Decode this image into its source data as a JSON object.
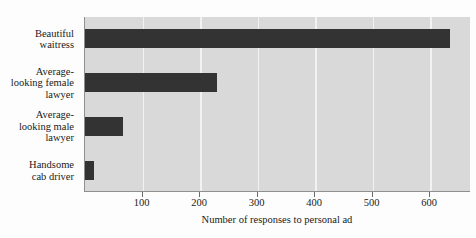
{
  "chart_data": {
    "type": "bar",
    "orientation": "horizontal",
    "title": "",
    "xlabel": "Number of responses to personal ad",
    "ylabel": "",
    "categories": [
      "Beautiful\nwaitress",
      "Average-\nlooking female\nlawyer",
      "Average-\nlooking male\nlawyer",
      "Handsome\ncab driver"
    ],
    "values": [
      635,
      230,
      66,
      16
    ],
    "xlim": [
      0,
      671
    ],
    "ylim": [
      0,
      4
    ],
    "xticks": [
      100,
      200,
      300,
      400,
      500,
      600
    ],
    "xticklabels": [
      "100",
      "200",
      "300",
      "400",
      "500",
      "600"
    ],
    "grid": true,
    "grid_axis": "x",
    "legend": null,
    "colors": {
      "bar": "#333333",
      "panel_background": "#d9d9d9",
      "gridline": "#f2f2f2",
      "axis_line": "#8f8f8f",
      "figure_background": "#fdfdfd",
      "text": "#1a1a1a"
    }
  },
  "axis": {
    "x_title": "Number of responses to personal ad"
  }
}
